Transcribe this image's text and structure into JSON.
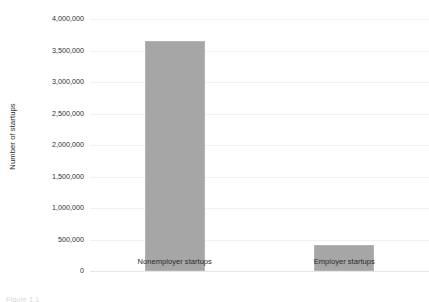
{
  "chart_data": {
    "type": "bar",
    "title": "",
    "subtitle": "",
    "xlabel": "",
    "ylabel": "Number of startups",
    "categories": [
      "Nonemployer startups",
      "Employer startups"
    ],
    "values": [
      3650000,
      420000
    ],
    "ylim": [
      0,
      4000000
    ],
    "ytick_values": [
      0,
      500000,
      1000000,
      1500000,
      2000000,
      2500000,
      3000000,
      3500000,
      4000000
    ],
    "ytick_labels": [
      "0",
      "500,000",
      "1,000,000",
      "1,500,000",
      "2,000,000",
      "2,500,000",
      "3,000,000",
      "3,500,000",
      "4,000,000"
    ],
    "grid": true,
    "grid_orientation": "horizontal",
    "legend": false,
    "legend_position": "none",
    "bar_color": "#a6a6a6",
    "grid_color": "#f1f1f1",
    "axis_color": "#e6e6e6",
    "background_color": "#ffffff"
  },
  "figure": {
    "caption": "Figure 1.1"
  }
}
